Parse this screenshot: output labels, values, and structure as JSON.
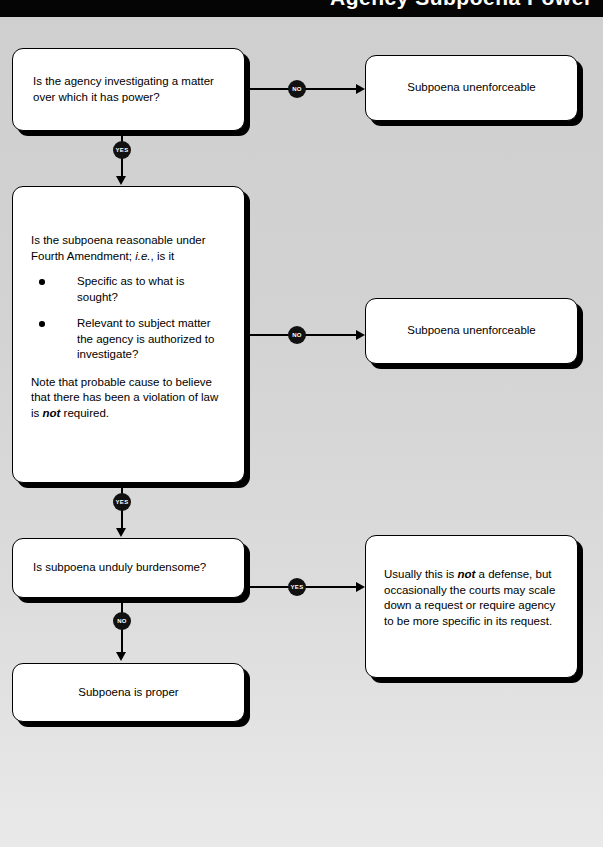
{
  "header": {
    "title": "Agency Subpoena Power",
    "background_color": "#050505",
    "text_color": "#ffffff"
  },
  "canvas": {
    "background_top_color": "#cfcfcf",
    "background_bottom_color": "#e9e9e9",
    "line_color": "#000000",
    "node_fill_color": "#ffffff",
    "node_border_color": "#000000",
    "badge_fill_color": "#111111",
    "badge_text_color": "#ffffff"
  },
  "flow": {
    "nodes": {
      "q1": {
        "id": "q1",
        "type": "decision",
        "text": "Is the agency investigating a matter over which it has power?"
      },
      "out1": {
        "id": "out1",
        "type": "terminal",
        "text": "Subpoena unenforceable"
      },
      "q2": {
        "id": "q2",
        "type": "decision",
        "lead_text_part1": "Is the subpoena reasonable under Fourth Amendment; ",
        "lead_text_italic": "i.e.",
        "lead_text_part2": ", is it",
        "bullets": [
          "Specific as to what is sought?",
          "Relevant to subject matter the agency is authorized to investigate?"
        ],
        "note_part1": "Note that probable cause to believe that there has been a violation of law is ",
        "note_emphasis": "not",
        "note_part2": " required."
      },
      "out2": {
        "id": "out2",
        "type": "terminal",
        "text": "Subpoena unenforceable"
      },
      "q3": {
        "id": "q3",
        "type": "decision",
        "text": "Is subpoena unduly burdensome?"
      },
      "out3": {
        "id": "out3",
        "type": "note",
        "text_part1": "Usually this is ",
        "text_emphasis": "not",
        "text_part2": " a defense, but occasionally the courts may scale down a request or require agency to be more specific in its request."
      },
      "final": {
        "id": "final",
        "type": "terminal",
        "text": "Subpoena is proper"
      }
    },
    "edges": [
      {
        "id": "e1",
        "from": "q1",
        "to": "out1",
        "label": "NO"
      },
      {
        "id": "e2",
        "from": "q1",
        "to": "q2",
        "label": "YES"
      },
      {
        "id": "e3",
        "from": "q2",
        "to": "out2",
        "label": "NO"
      },
      {
        "id": "e4",
        "from": "q2",
        "to": "q3",
        "label": "YES"
      },
      {
        "id": "e5",
        "from": "q3",
        "to": "out3",
        "label": "YES"
      },
      {
        "id": "e6",
        "from": "q3",
        "to": "final",
        "label": "NO"
      }
    ]
  }
}
